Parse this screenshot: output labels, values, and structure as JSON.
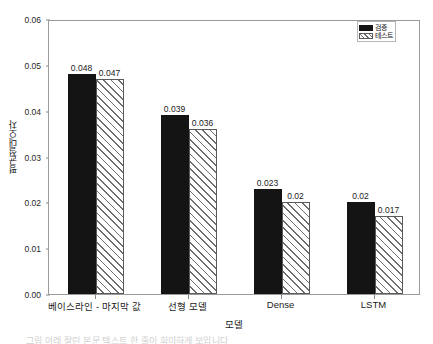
{
  "chart_data": {
    "type": "bar",
    "title": "",
    "xlabel": "모델",
    "ylabel": "평균절대오차",
    "categories": [
      "베이스라인 - 마지막 값",
      "선형 모델",
      "Dense",
      "LSTM"
    ],
    "series": [
      {
        "name": "검증",
        "values": [
          0.048,
          0.039,
          0.023,
          0.02
        ],
        "style": "solid-black"
      },
      {
        "name": "테스트",
        "values": [
          0.047,
          0.036,
          0.02,
          0.017
        ],
        "style": "white-diagonal-hatch"
      }
    ],
    "value_labels": [
      [
        "0.048",
        "0.047"
      ],
      [
        "0.039",
        "0.036"
      ],
      [
        "0.023",
        "0.02"
      ],
      [
        "0.02",
        "0.017"
      ]
    ],
    "ylim": [
      0.0,
      0.06
    ],
    "yticks": [
      "0.00",
      "0.01",
      "0.02",
      "0.03",
      "0.04",
      "0.05",
      "0.06"
    ],
    "ytick_values": [
      0.0,
      0.01,
      0.02,
      0.03,
      0.04,
      0.05,
      0.06
    ],
    "grid": false,
    "legend_position": "top-right",
    "legend_entries": [
      "검증",
      "테스트"
    ],
    "colors": {
      "validation_bar": "#141414",
      "test_bar_face": "#ffffff",
      "test_bar_hatch": "#6e6e6e",
      "axis": "#9a9a9a",
      "text": "#1a1a1a",
      "background": "#ffffff"
    }
  },
  "caption": "그림 아래 잘린 본문 텍스트 한 줄이 희미하게 보입니다"
}
